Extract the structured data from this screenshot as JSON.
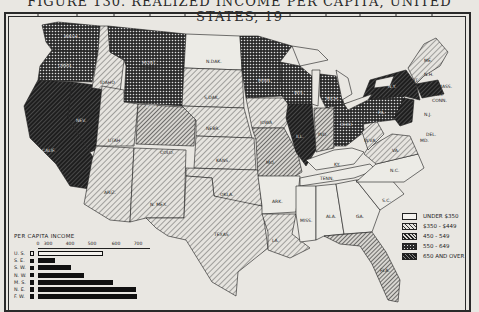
{
  "figure": {
    "title": "FIGURE 130. REALIZED INCOME PER CAPITA, UNITED STATES, 19"
  },
  "legend": {
    "title": "",
    "items": [
      {
        "label": "UNDER $350",
        "pattern": "blank"
      },
      {
        "label": "$350 - $449",
        "pattern": "light-hatch"
      },
      {
        "label": "450 - 549",
        "pattern": "medium-hatch"
      },
      {
        "label": "550 - 649",
        "pattern": "dots"
      },
      {
        "label": "650 AND OVER",
        "pattern": "heavy-hatch"
      }
    ]
  },
  "state_labels": {
    "wash": "WASH.",
    "oreg": "OREG.",
    "calif": "CALIF.",
    "idaho": "IDAHO",
    "nev": "NEV.",
    "mont": "MONT.",
    "wyo": "WYO.",
    "utah": "UTAH",
    "colo": "COLO.",
    "ariz": "ARIZ.",
    "nmex": "N. MEX.",
    "ndak": "N.DAK.",
    "sdak": "S.DAK.",
    "nebr": "NEBR.",
    "kans": "KANS.",
    "okla": "OKLA.",
    "texas": "TEXAS",
    "minn": "MINN.",
    "iowa": "IOWA",
    "mo": "MO.",
    "ark": "ARK.",
    "la": "LA.",
    "wis": "WIS.",
    "ill": "ILL.",
    "mich": "MICH.",
    "ind": "IND.",
    "ohio": "OHIO",
    "ky": "KY.",
    "tenn": "TENN.",
    "miss": "MISS.",
    "ala": "ALA.",
    "ga": "GA.",
    "fla": "FLA.",
    "sc": "S.C.",
    "nc": "N.C.",
    "va": "VA.",
    "wva": "W.VA.",
    "pa": "PA.",
    "ny": "N.Y.",
    "vt": "VT.",
    "nh": "N.H.",
    "me": "ME.",
    "mass": "MASS.",
    "ri": "R.I.",
    "conn": "CONN.",
    "nj": "N.J.",
    "del": "DEL.",
    "md": "MD."
  },
  "chart_data": {
    "type": "bar",
    "title": "PER CAPITA INCOME",
    "orientation": "horizontal",
    "axis_ticks": [
      0,
      300,
      400,
      500,
      600,
      700
    ],
    "axis_break": "between 0 and 300",
    "categories": [
      "U. S.",
      "S. E.",
      "S. W.",
      "N. W.",
      "M. S.",
      "N. E.",
      "F. W."
    ],
    "values": [
      545,
      330,
      400,
      460,
      590,
      690,
      695
    ],
    "highlighted": "U. S.",
    "xlim": [
      0,
      700
    ]
  }
}
